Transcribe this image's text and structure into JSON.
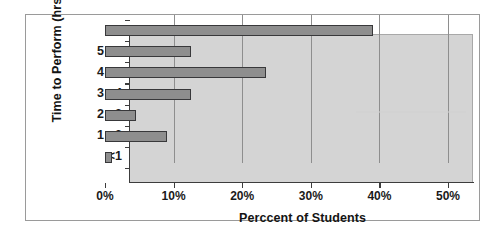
{
  "chart_data": {
    "type": "bar",
    "orientation": "horizontal",
    "title": "",
    "xlabel": "Perccent of Students",
    "ylabel": "Time to Perform (hrs)",
    "categories": [
      "<1",
      "1 - 2",
      "2 - 3",
      "3 - 4",
      "4 - 5",
      "5 - 6",
      ">6"
    ],
    "values": [
      1,
      9,
      4.5,
      12.5,
      23.5,
      12.5,
      39
    ],
    "xlim": [
      0,
      50
    ],
    "xticks": [
      0,
      10,
      20,
      30,
      40,
      50
    ],
    "xticklabels": [
      "0%",
      "10%",
      "20%",
      "30%",
      "40%",
      "50%"
    ],
    "grid": "vertical",
    "legend": "none",
    "bar_color": "#8e8e8e",
    "bar_edge_color": "#38383a",
    "plot_background": "#d4d4d4",
    "figure_background": "#ffffff"
  }
}
